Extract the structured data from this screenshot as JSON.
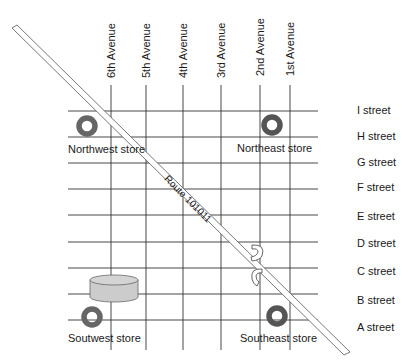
{
  "avenues": [
    {
      "label": "6th Avenue",
      "x": 111
    },
    {
      "label": "5th Avenue",
      "x": 146
    },
    {
      "label": "4th Avenue",
      "x": 183
    },
    {
      "label": "3rd Avenue",
      "x": 221
    },
    {
      "label": "2nd Avenue",
      "x": 260
    },
    {
      "label": "1st Avenue",
      "x": 290
    }
  ],
  "streets": [
    {
      "label": "I street",
      "y": 111
    },
    {
      "label": "H street",
      "y": 137
    },
    {
      "label": "G street",
      "y": 163
    },
    {
      "label": "F street",
      "y": 189
    },
    {
      "label": "E street",
      "y": 215
    },
    {
      "label": "D street",
      "y": 242
    },
    {
      "label": "C street",
      "y": 268
    },
    {
      "label": "B street",
      "y": 294
    },
    {
      "label": "A street",
      "y": 320
    }
  ],
  "stores": [
    {
      "label": "Northwest store",
      "icon": "store-ring-icon"
    },
    {
      "label": "Northeast store",
      "icon": "store-ring-icon"
    },
    {
      "label": "Soutwest store",
      "icon": "store-ring-icon"
    },
    {
      "label": "Southeast store",
      "icon": "store-ring-icon"
    }
  ],
  "route": {
    "label": "Route 101011"
  },
  "warehouse": {
    "icon": "warehouse-cylinder-icon"
  },
  "colors": {
    "grid": "#333333",
    "store_ring": "#666666",
    "warehouse_fill": "#cccccc",
    "route_outline": "#555555"
  }
}
